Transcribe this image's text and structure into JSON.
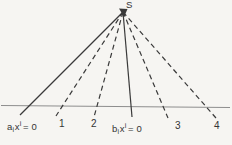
{
  "figure": {
    "apex_label": "S",
    "equations": {
      "a": {
        "coef": "a",
        "sub": "i",
        "var": "x",
        "sup": "i",
        "rhs": "= 0"
      },
      "b": {
        "coef": "b",
        "sub": "i",
        "var": "x",
        "sup": "i",
        "rhs": "= 0"
      }
    },
    "ray_numbers": {
      "r1": "1",
      "r2": "2",
      "r3": "3",
      "r4": "4"
    },
    "colors": {
      "ink": "#3a3a3a",
      "baseline": "#8d8d8d",
      "paper": "#f6f5f2"
    },
    "geometry": {
      "apex": {
        "x": 123,
        "y": 12
      },
      "baseline": {
        "x1": 1,
        "y1": 105.5,
        "x2": 230,
        "y2": 107.5
      },
      "rays": [
        {
          "name": "line-a-solid",
          "style": "solid",
          "x2": 20,
          "y2": 115
        },
        {
          "name": "ray-1-dashed",
          "style": "dashed",
          "x2": 56,
          "y2": 116
        },
        {
          "name": "ray-2-dashed",
          "style": "dashed",
          "x2": 94,
          "y2": 117
        },
        {
          "name": "line-b-solid",
          "style": "solid",
          "x2": 132,
          "y2": 117
        },
        {
          "name": "ray-3-dashed",
          "style": "dashed",
          "x2": 168,
          "y2": 118
        },
        {
          "name": "ray-4-dashed",
          "style": "dashed",
          "x2": 216,
          "y2": 118
        }
      ]
    }
  }
}
